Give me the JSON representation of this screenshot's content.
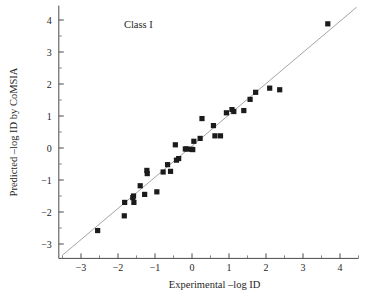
{
  "chart_data": {
    "type": "scatter",
    "title": "",
    "annotation": "Class I",
    "xlabel": "Experimental –log ID",
    "ylabel": "Predicted –log ID by CoMSIA",
    "xlim": [
      -3.6,
      4.5
    ],
    "ylim": [
      -3.45,
      4.45
    ],
    "xticks": [
      -3,
      -2,
      -1,
      0,
      1,
      2,
      3,
      4
    ],
    "yticks": [
      -3,
      -2,
      -1,
      0,
      1,
      2,
      3,
      4
    ],
    "xtick_labels": [
      "−3",
      "−2",
      "−1",
      "0",
      "1",
      "2",
      "3",
      "4"
    ],
    "ytick_labels": [
      "−3",
      "−2",
      "−1",
      "0",
      "1",
      "2",
      "3",
      "4"
    ],
    "minor_ticks": true,
    "grid": false,
    "legend": false,
    "marker_style": "filled-square",
    "marker_color": "#1b1b1b",
    "trend_line": {
      "label": "identity line",
      "color": "#9a9a9a",
      "x_start": -3.5,
      "y_start": -3.35,
      "x_end": 4.45,
      "y_end": 4.4
    },
    "points": [
      {
        "x": -2.55,
        "y": -2.58
      },
      {
        "x": -1.83,
        "y": -2.12
      },
      {
        "x": -1.82,
        "y": -1.7
      },
      {
        "x": -1.6,
        "y": -1.55
      },
      {
        "x": -1.58,
        "y": -1.5
      },
      {
        "x": -1.57,
        "y": -1.7
      },
      {
        "x": -1.4,
        "y": -1.18
      },
      {
        "x": -1.28,
        "y": -1.45
      },
      {
        "x": -1.22,
        "y": -0.7
      },
      {
        "x": -1.21,
        "y": -0.8
      },
      {
        "x": -0.95,
        "y": -1.37
      },
      {
        "x": -0.78,
        "y": -0.75
      },
      {
        "x": -0.66,
        "y": -0.52
      },
      {
        "x": -0.58,
        "y": -0.73
      },
      {
        "x": -0.45,
        "y": 0.1
      },
      {
        "x": -0.42,
        "y": -0.38
      },
      {
        "x": -0.36,
        "y": -0.33
      },
      {
        "x": -0.18,
        "y": -0.03
      },
      {
        "x": -0.14,
        "y": -0.03
      },
      {
        "x": -0.02,
        "y": -0.04
      },
      {
        "x": 0.02,
        "y": -0.05
      },
      {
        "x": 0.05,
        "y": 0.21
      },
      {
        "x": 0.22,
        "y": 0.3
      },
      {
        "x": 0.27,
        "y": 0.92
      },
      {
        "x": 0.58,
        "y": 0.7
      },
      {
        "x": 0.62,
        "y": 0.38
      },
      {
        "x": 0.77,
        "y": 0.38
      },
      {
        "x": 0.93,
        "y": 1.1
      },
      {
        "x": 1.08,
        "y": 1.2
      },
      {
        "x": 1.13,
        "y": 1.14
      },
      {
        "x": 1.4,
        "y": 1.17
      },
      {
        "x": 1.57,
        "y": 1.52
      },
      {
        "x": 1.72,
        "y": 1.74
      },
      {
        "x": 2.1,
        "y": 1.87
      },
      {
        "x": 2.37,
        "y": 1.82
      },
      {
        "x": 3.67,
        "y": 3.88
      }
    ]
  }
}
